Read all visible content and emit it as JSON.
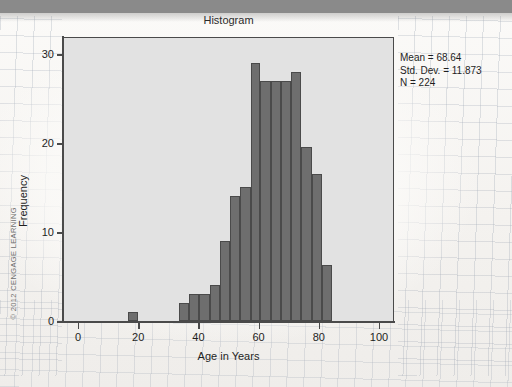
{
  "page": {
    "copyright": "© 2012 CENGAGE LEARNING",
    "topbar_color": "#8a8a8a",
    "paper_color": "#f7f5f2"
  },
  "chart_data": {
    "type": "bar",
    "subtype": "histogram",
    "title": "Histogram",
    "xlabel": "Age in Years",
    "ylabel": "Frequency",
    "xlim": [
      -5,
      105
    ],
    "ylim": [
      0,
      32
    ],
    "xticks": [
      0,
      20,
      40,
      60,
      80,
      100
    ],
    "yticks": [
      0,
      10,
      20,
      30
    ],
    "xtick_labels": [
      "0",
      "20",
      "40",
      "60",
      "80",
      "100"
    ],
    "ytick_labels": [
      "0",
      "10",
      "20",
      "30"
    ],
    "grid": false,
    "legend": "none",
    "bin_width": 3.39,
    "bar_color": "#6e6e6e",
    "bar_edge_color": "#4a4a4a",
    "plot_bg_color": "#e2e2e2",
    "bins": [
      {
        "x_left": 16.3,
        "x_right": 19.7,
        "value": 1
      },
      {
        "x_left": 33.2,
        "x_right": 36.6,
        "value": 2
      },
      {
        "x_left": 36.6,
        "x_right": 40.0,
        "value": 3
      },
      {
        "x_left": 40.0,
        "x_right": 43.4,
        "value": 3
      },
      {
        "x_left": 43.4,
        "x_right": 46.8,
        "value": 4
      },
      {
        "x_left": 46.8,
        "x_right": 50.2,
        "value": 9
      },
      {
        "x_left": 50.2,
        "x_right": 53.6,
        "value": 14
      },
      {
        "x_left": 53.6,
        "x_right": 57.0,
        "value": 15
      },
      {
        "x_left": 57.0,
        "x_right": 60.3,
        "value": 29
      },
      {
        "x_left": 60.3,
        "x_right": 63.7,
        "value": 27
      },
      {
        "x_left": 63.7,
        "x_right": 67.1,
        "value": 27
      },
      {
        "x_left": 67.1,
        "x_right": 70.5,
        "value": 27
      },
      {
        "x_left": 70.5,
        "x_right": 73.9,
        "value": 28
      },
      {
        "x_left": 73.9,
        "x_right": 77.3,
        "value": 19.5
      },
      {
        "x_left": 77.3,
        "x_right": 80.7,
        "value": 16.5
      },
      {
        "x_left": 80.7,
        "x_right": 84.1,
        "value": 6.3
      }
    ],
    "annotations": {
      "mean_label": "Mean = 68.64",
      "std_dev_label": "Std. Dev. = 11.873",
      "n_label": "N = 224"
    },
    "statistics": {
      "mean": 68.64,
      "std_dev": 11.873,
      "n": 224
    }
  }
}
